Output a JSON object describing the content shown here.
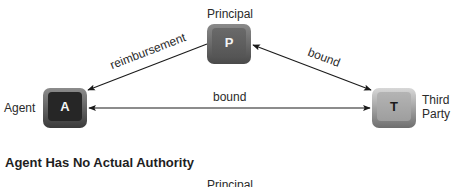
{
  "diagram": {
    "nodes": [
      {
        "id": "principal",
        "letter": "P",
        "label": "Principal"
      },
      {
        "id": "agent",
        "letter": "A",
        "label": "Agent"
      },
      {
        "id": "third_party",
        "letter": "T",
        "label_line1": "Third",
        "label_line2": "Party"
      }
    ],
    "edges": [
      {
        "from": "principal",
        "to": "agent",
        "label": "reimbursement",
        "direction": "one-way"
      },
      {
        "from": "principal",
        "to": "third_party",
        "label": "bound",
        "direction": "two-way"
      },
      {
        "from": "agent",
        "to": "third_party",
        "label": "bound",
        "direction": "two-way"
      }
    ]
  },
  "section": {
    "heading": "Agent Has No Actual Authority",
    "next_principal_label": "Principal"
  }
}
